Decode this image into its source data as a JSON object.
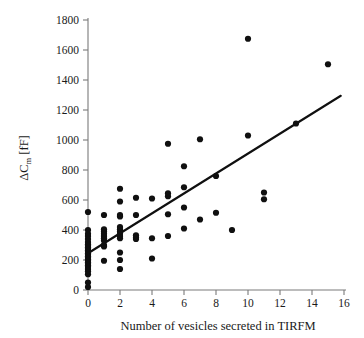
{
  "chart_data": {
    "type": "scatter",
    "title": "",
    "xlabel": "Number of vesicles secreted in TIRFM",
    "ylabel": "ΔCₘ [fF]",
    "ylabel_parts": {
      "delta": "Δ",
      "c": "C",
      "sub": "m",
      "unit": " [fF]"
    },
    "xlim": [
      0,
      16
    ],
    "ylim": [
      0,
      1800
    ],
    "xticks": [
      0,
      2,
      4,
      6,
      8,
      10,
      12,
      14,
      16
    ],
    "yticks": [
      0,
      200,
      400,
      600,
      800,
      1000,
      1200,
      1400,
      1600,
      1800
    ],
    "xtick_labels": [
      "0",
      "2",
      "4",
      "6",
      "8",
      "10",
      "12",
      "14",
      "16"
    ],
    "ytick_labels": [
      "0",
      "200",
      "400",
      "600",
      "800",
      "1000",
      "1200",
      "1400",
      "1600",
      "1800"
    ],
    "grid": false,
    "legend": null,
    "marker": {
      "shape": "circle",
      "color": "#101010",
      "size": 3.1
    },
    "series": [
      {
        "name": "cells",
        "points": [
          [
            0,
            20
          ],
          [
            0,
            50
          ],
          [
            0,
            105
          ],
          [
            0,
            125
          ],
          [
            0,
            140
          ],
          [
            0,
            155
          ],
          [
            0,
            165
          ],
          [
            0,
            175
          ],
          [
            0,
            185
          ],
          [
            0,
            195
          ],
          [
            0,
            205
          ],
          [
            0,
            215
          ],
          [
            0,
            225
          ],
          [
            0,
            235
          ],
          [
            0,
            245
          ],
          [
            0,
            255
          ],
          [
            0,
            265
          ],
          [
            0,
            275
          ],
          [
            0,
            285
          ],
          [
            0,
            295
          ],
          [
            0,
            305
          ],
          [
            0,
            320
          ],
          [
            0,
            340
          ],
          [
            0,
            360
          ],
          [
            0,
            375
          ],
          [
            0,
            400
          ],
          [
            0,
            520
          ],
          [
            1,
            195
          ],
          [
            1,
            290
          ],
          [
            1,
            300
          ],
          [
            1,
            330
          ],
          [
            1,
            345
          ],
          [
            1,
            360
          ],
          [
            1,
            375
          ],
          [
            1,
            390
          ],
          [
            1,
            405
          ],
          [
            1,
            500
          ],
          [
            2,
            140
          ],
          [
            2,
            200
          ],
          [
            2,
            250
          ],
          [
            2,
            345
          ],
          [
            2,
            360
          ],
          [
            2,
            375
          ],
          [
            2,
            390
          ],
          [
            2,
            405
          ],
          [
            2,
            420
          ],
          [
            2,
            490
          ],
          [
            2,
            500
          ],
          [
            2,
            590
          ],
          [
            2,
            675
          ],
          [
            3,
            340
          ],
          [
            3,
            350
          ],
          [
            3,
            365
          ],
          [
            3,
            500
          ],
          [
            3,
            615
          ],
          [
            4,
            210
          ],
          [
            4,
            345
          ],
          [
            4,
            610
          ],
          [
            5,
            360
          ],
          [
            5,
            505
          ],
          [
            5,
            625
          ],
          [
            5,
            645
          ],
          [
            5,
            975
          ],
          [
            6,
            410
          ],
          [
            6,
            550
          ],
          [
            6,
            685
          ],
          [
            6,
            825
          ],
          [
            7,
            470
          ],
          [
            7,
            1005
          ],
          [
            8,
            515
          ],
          [
            8,
            760
          ],
          [
            9,
            400
          ],
          [
            10,
            1030
          ],
          [
            10,
            1675
          ],
          [
            11,
            605
          ],
          [
            11,
            650
          ],
          [
            13,
            1110
          ],
          [
            15,
            1505
          ]
        ]
      }
    ],
    "fit_line": {
      "name": "linear regression",
      "x0": 0,
      "y0": 245,
      "x1": 15.8,
      "y1": 1295,
      "color": "#101010"
    }
  },
  "style": {
    "axis_color": "#7a7a7a",
    "text_color": "#1a1a1a",
    "marker_color": "#101010",
    "background": "#ffffff"
  }
}
